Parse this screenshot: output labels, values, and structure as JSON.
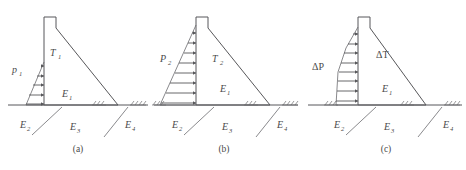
{
  "figure": {
    "line_color": "#57575a",
    "text_color": "#4a4a4a",
    "background": "#ffffff"
  },
  "panels": [
    {
      "id": "a",
      "caption": "(a)",
      "pressure_label": "p",
      "pressure_sub": "1",
      "thrust_label": "T",
      "thrust_sub": "1",
      "reactions": [
        {
          "label": "E",
          "sub": "1"
        },
        {
          "label": "E",
          "sub": "2"
        },
        {
          "label": "E",
          "sub": "3"
        },
        {
          "label": "E",
          "sub": "4"
        }
      ],
      "arrow_count": 5,
      "pressure_shape": "triangular-partial",
      "pressure_height_fraction": 0.42
    },
    {
      "id": "b",
      "caption": "(b)",
      "pressure_label": "P",
      "pressure_sub": "2",
      "thrust_label": "T",
      "thrust_sub": "2",
      "reactions": [
        {
          "label": "E",
          "sub": "1"
        },
        {
          "label": "E",
          "sub": "2"
        },
        {
          "label": "E",
          "sub": "3"
        },
        {
          "label": "E",
          "sub": "4"
        }
      ],
      "arrow_count": 8,
      "pressure_shape": "triangular-full",
      "pressure_height_fraction": 0.92
    },
    {
      "id": "c",
      "caption": "(c)",
      "pressure_label": "ΔP",
      "pressure_sub": "",
      "thrust_label": "ΔT",
      "thrust_sub": "",
      "reactions": [
        {
          "label": "E",
          "sub": "1"
        },
        {
          "label": "E",
          "sub": "2"
        },
        {
          "label": "E",
          "sub": "3"
        },
        {
          "label": "E",
          "sub": "4"
        }
      ],
      "arrow_count": 8,
      "pressure_shape": "trapezoidal",
      "pressure_height_fraction": 0.92
    }
  ]
}
